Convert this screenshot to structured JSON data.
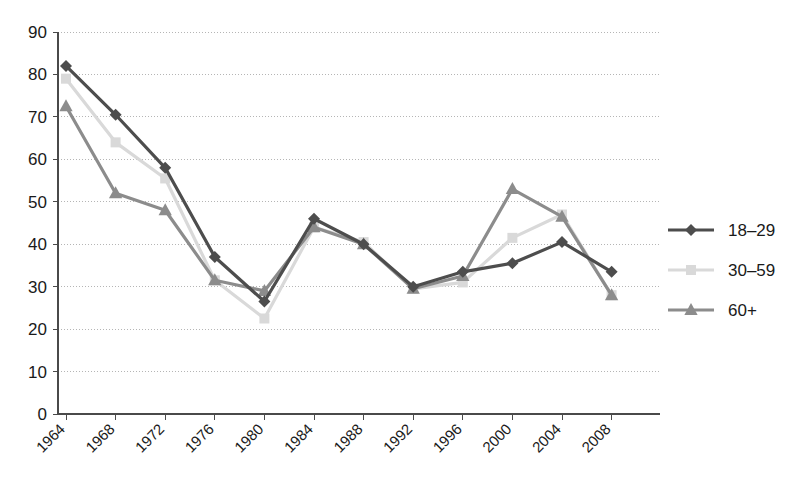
{
  "chart_data": {
    "type": "line",
    "title": "",
    "xlabel": "",
    "ylabel": "",
    "categories": [
      "1964",
      "1968",
      "1972",
      "1976",
      "1980",
      "1984",
      "1988",
      "1992",
      "1996",
      "2000",
      "2004",
      "2008"
    ],
    "ylim": [
      0,
      90
    ],
    "yticks": [
      "0",
      "10",
      "20",
      "30",
      "40",
      "50",
      "60",
      "70",
      "80",
      "90"
    ],
    "grid": true,
    "legend_position": "right",
    "series": [
      {
        "name": "18–29",
        "marker": "diamond",
        "color": "#4d4d4d",
        "values": [
          82,
          70.5,
          58,
          37,
          26.5,
          46,
          40,
          30,
          33.5,
          35.5,
          40.5,
          33.5
        ]
      },
      {
        "name": "30–59",
        "marker": "square",
        "color": "#d9d9d9",
        "values": [
          79,
          64,
          55.5,
          31.5,
          22.5,
          44,
          40.5,
          29.5,
          31,
          41.5,
          47,
          28
        ]
      },
      {
        "name": "60+",
        "marker": "triangle",
        "color": "#8c8c8c",
        "values": [
          72.5,
          52,
          48,
          31.5,
          29,
          44,
          40,
          29.5,
          32.5,
          53,
          46.5,
          28
        ]
      }
    ]
  },
  "colors": {
    "axis": "#4a4a4a",
    "grid": "#b5b5b5",
    "background": "#ffffff",
    "text": "#1a1a1a"
  }
}
